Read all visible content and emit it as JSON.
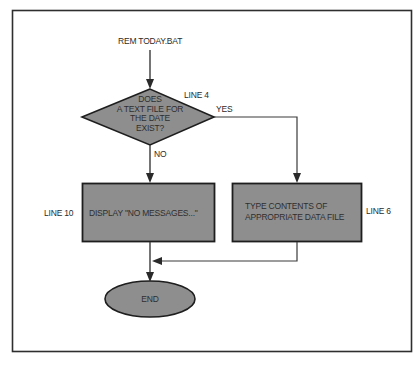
{
  "diagram": {
    "type": "flowchart",
    "colors": {
      "shape_fill": "#8e8e8e",
      "shape_stroke": "#1e1e1e",
      "line": "#3a3a3a",
      "frame": "#2e2e2e",
      "background": "#ffffff",
      "text": "#2b2b2b"
    },
    "start_label": "REM TODAY.BAT",
    "decision": {
      "lines": [
        "DOES",
        "A TEXT FILE FOR",
        "THE DATE",
        "EXIST?"
      ],
      "line_ref": "LINE 4",
      "yes_label": "YES",
      "no_label": "NO"
    },
    "no_branch": {
      "text": "DISPLAY \"NO MESSAGES...\"",
      "line_ref": "LINE 10"
    },
    "yes_branch": {
      "lines": [
        "TYPE CONTENTS OF",
        "APPROPRIATE DATA FILE"
      ],
      "line_ref": "LINE 6"
    },
    "end": {
      "text": "END"
    },
    "edges": [
      {
        "from": "start",
        "to": "decision"
      },
      {
        "from": "decision",
        "to": "yes_branch",
        "label": "YES"
      },
      {
        "from": "decision",
        "to": "no_branch",
        "label": "NO"
      },
      {
        "from": "no_branch",
        "to": "end"
      },
      {
        "from": "yes_branch",
        "to": "end"
      }
    ]
  }
}
